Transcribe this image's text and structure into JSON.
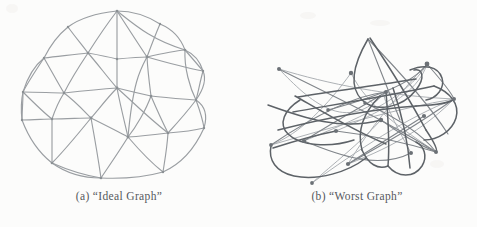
{
  "figure": {
    "background_color": "#fcfcfb",
    "ink_color": "#8e9296",
    "ink_color_dark": "#5b6065",
    "caption_color": "#55585c",
    "panels": [
      {
        "id": "a",
        "tag": "(a)",
        "caption": "(a)  “Ideal Graph”",
        "title": "“Ideal Graph”",
        "kind": "planar-triangulated-hand-drawing",
        "node_count": 22,
        "nodes": [
          {
            "id": 0,
            "x": 117,
            "y": 11
          },
          {
            "id": 1,
            "x": 68,
            "y": 27
          },
          {
            "id": 2,
            "x": 160,
            "y": 24
          },
          {
            "id": 3,
            "x": 44,
            "y": 58
          },
          {
            "id": 4,
            "x": 88,
            "y": 53
          },
          {
            "id": 5,
            "x": 117,
            "y": 59
          },
          {
            "id": 6,
            "x": 147,
            "y": 57
          },
          {
            "id": 7,
            "x": 185,
            "y": 50
          },
          {
            "id": 8,
            "x": 203,
            "y": 71
          },
          {
            "id": 9,
            "x": 23,
            "y": 92
          },
          {
            "id": 10,
            "x": 64,
            "y": 93
          },
          {
            "id": 11,
            "x": 117,
            "y": 88
          },
          {
            "id": 12,
            "x": 151,
            "y": 96
          },
          {
            "id": 13,
            "x": 196,
            "y": 100
          },
          {
            "id": 14,
            "x": 22,
            "y": 120
          },
          {
            "id": 15,
            "x": 52,
            "y": 119
          },
          {
            "id": 16,
            "x": 91,
            "y": 118
          },
          {
            "id": 17,
            "x": 128,
            "y": 137
          },
          {
            "id": 18,
            "x": 168,
            "y": 133
          },
          {
            "id": 19,
            "x": 204,
            "y": 128
          },
          {
            "id": 20,
            "x": 52,
            "y": 163
          },
          {
            "id": 21,
            "x": 101,
            "y": 178
          },
          {
            "id": 22,
            "x": 163,
            "y": 172
          }
        ]
      },
      {
        "id": "b",
        "tag": "(b)",
        "caption": "(b)  “Worst Graph”",
        "title": "“Worst Graph”",
        "kind": "tangled-crossing-hand-drawing",
        "node_count": 16,
        "nodes": [
          {
            "id": 0,
            "x": 41,
            "y": 69
          },
          {
            "id": 1,
            "x": 113,
            "y": 73
          },
          {
            "id": 2,
            "x": 189,
            "y": 64
          },
          {
            "id": 3,
            "x": 143,
            "y": 120
          },
          {
            "id": 4,
            "x": 216,
            "y": 99
          },
          {
            "id": 5,
            "x": 98,
            "y": 131
          },
          {
            "id": 6,
            "x": 173,
            "y": 153
          },
          {
            "id": 7,
            "x": 198,
            "y": 152
          },
          {
            "id": 8,
            "x": 33,
            "y": 145
          },
          {
            "id": 9,
            "x": 66,
            "y": 141
          },
          {
            "id": 10,
            "x": 110,
            "y": 164
          },
          {
            "id": 11,
            "x": 74,
            "y": 183
          },
          {
            "id": 12,
            "x": 148,
            "y": 92
          },
          {
            "id": 13,
            "x": 186,
            "y": 116
          },
          {
            "id": 14,
            "x": 127,
            "y": 103
          },
          {
            "id": 15,
            "x": 90,
            "y": 110
          }
        ]
      }
    ]
  }
}
